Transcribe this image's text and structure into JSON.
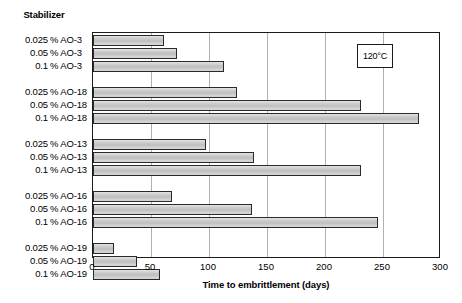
{
  "chart_data": {
    "type": "bar",
    "orientation": "horizontal",
    "title": "",
    "category_header": "Stabilizer",
    "xlabel": "Time to embrittlement  (days)",
    "ylabel": "",
    "xlim": [
      0,
      300
    ],
    "xticks": [
      0,
      50,
      100,
      150,
      200,
      250,
      300
    ],
    "xtick_labels": [
      "0",
      "50",
      "100",
      "150",
      "200",
      "250",
      "300"
    ],
    "grid": true,
    "legend": false,
    "annotations": [
      {
        "text": "120°C",
        "x": 243,
        "boxed": true
      }
    ],
    "groups": [
      {
        "name": "AO-3",
        "items": [
          {
            "conc": "0.025",
            "unit": "% AO-3",
            "value": 61
          },
          {
            "conc": "0.05",
            "unit": "% AO-3",
            "value": 72
          },
          {
            "conc": "0.1",
            "unit": "% AO-3",
            "value": 113
          }
        ]
      },
      {
        "name": "AO-18",
        "items": [
          {
            "conc": "0.025",
            "unit": "% AO-18",
            "value": 124
          },
          {
            "conc": "0.05",
            "unit": "% AO-18",
            "value": 231
          },
          {
            "conc": "0.1",
            "unit": "% AO-18",
            "value": 281
          }
        ]
      },
      {
        "name": "AO-13",
        "items": [
          {
            "conc": "0.025",
            "unit": "% AO-13",
            "value": 97
          },
          {
            "conc": "0.05",
            "unit": "% AO-13",
            "value": 139
          },
          {
            "conc": "0.1",
            "unit": "% AO-13",
            "value": 231
          }
        ]
      },
      {
        "name": "AO-16",
        "items": [
          {
            "conc": "0.025",
            "unit": "% AO-16",
            "value": 68
          },
          {
            "conc": "0.05",
            "unit": "% AO-16",
            "value": 137
          },
          {
            "conc": "0.1",
            "unit": "% AO-16",
            "value": 246
          }
        ]
      },
      {
        "name": "AO-19",
        "items": [
          {
            "conc": "0.025",
            "unit": "% AO-19",
            "value": 18
          },
          {
            "conc": "0.05",
            "unit": "% AO-19",
            "value": 38
          },
          {
            "conc": "0.1",
            "unit": "% AO-19",
            "value": 58
          }
        ]
      }
    ],
    "colors": {
      "bar_fill": "#c6c6c6",
      "bar_border": "#2a2a2a",
      "gridline": "#b0b0b0",
      "axis": "#1a1a1a",
      "text": "#000000",
      "background": "#ffffff"
    }
  }
}
